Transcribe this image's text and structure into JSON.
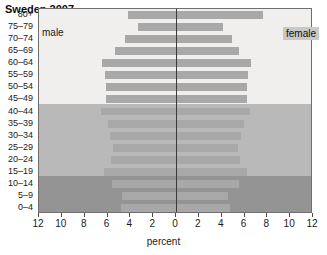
{
  "chart": {
    "title": "Sweden 2007",
    "male_legend": "male",
    "female_legend": "female",
    "xlabel": "percent"
  },
  "chart_data": {
    "type": "bar",
    "subtype": "population-pyramid",
    "title": "Sweden 2007",
    "xlabel": "percent",
    "ylabel": "",
    "grid": false,
    "legend_position": "inside-top",
    "axis_center_value": 0,
    "xlim": [
      -12,
      12
    ],
    "x_ticks": [
      12,
      10,
      8,
      6,
      4,
      2,
      0,
      2,
      4,
      6,
      8,
      10,
      12
    ],
    "x_tick_labels": [
      "12",
      "10",
      "8",
      "6",
      "4",
      "2",
      "0",
      "2",
      "4",
      "6",
      "8",
      "10",
      "12"
    ],
    "categories": [
      "80+",
      "75-79",
      "70-74",
      "65-69",
      "60-64",
      "55-59",
      "50-54",
      "45-49",
      "40-44",
      "35-39",
      "30-34",
      "25-29",
      "20-24",
      "15-19",
      "10-14",
      "5-9",
      "0-4"
    ],
    "series": [
      {
        "name": "male",
        "side": "left",
        "values": [
          4.2,
          3.3,
          4.5,
          5.3,
          6.5,
          6.2,
          6.1,
          6.1,
          6.6,
          6.0,
          5.8,
          5.5,
          5.7,
          6.3,
          5.6,
          4.7,
          4.8
        ]
      },
      {
        "name": "female",
        "side": "right",
        "values": [
          7.5,
          4.0,
          4.8,
          5.4,
          6.5,
          6.2,
          6.1,
          6.1,
          6.4,
          5.9,
          5.6,
          5.3,
          5.5,
          6.1,
          5.4,
          4.5,
          4.6
        ]
      }
    ],
    "background_bands": [
      {
        "label": "older",
        "from_age": "45-49",
        "to_age": "80+",
        "color": "#f0efee"
      },
      {
        "label": "working",
        "from_age": "15-19",
        "to_age": "40-44",
        "color": "#b9b9b9"
      },
      {
        "label": "children",
        "from_age": "0-4",
        "to_age": "10-14",
        "color": "#949494"
      }
    ],
    "bar_color": "#a8a8a8"
  }
}
